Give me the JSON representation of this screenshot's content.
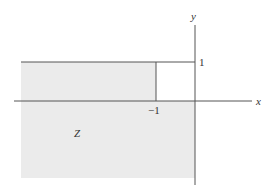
{
  "diagram": {
    "region_label": "Z",
    "axis_x_label": "x",
    "axis_y_label": "y",
    "tick_y_label": "1",
    "tick_x_label": "−1",
    "colors": {
      "shade": "#ebebeb",
      "line": "#555555",
      "text": "#333333"
    }
  }
}
